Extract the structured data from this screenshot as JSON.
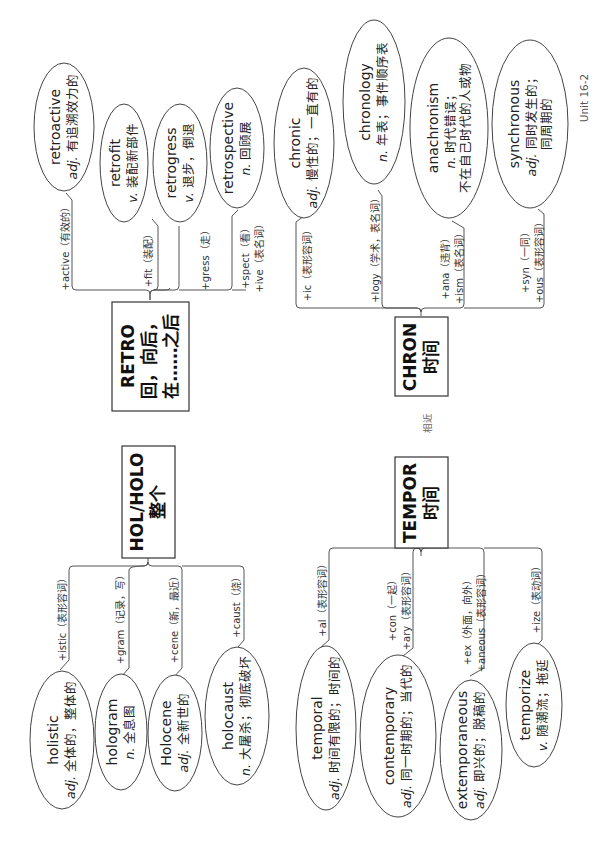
{
  "unit_label": "Unit 16-2",
  "relation_label": "相近",
  "roots": {
    "retro": {
      "title": "RETRO",
      "meaning_lines": [
        "回，向后，",
        "在……之后"
      ],
      "branches": [
        {
          "affix_lines": [
            "+active（有效的）"
          ],
          "word": "retroactive",
          "pos": "adj.",
          "definition_lines": [
            "有追溯效力的"
          ]
        },
        {
          "affix_lines": [
            "+fit（装配）"
          ],
          "word": "retrofit",
          "pos": "v.",
          "definition_lines": [
            "装配新部件"
          ]
        },
        {
          "affix_lines": [
            "+gress（走）"
          ],
          "word": "retrogress",
          "pos": "v.",
          "definition_lines": [
            "退步，倒退"
          ]
        },
        {
          "affix_lines": [
            "+spect（看）",
            "+ive（表名词）"
          ],
          "word": "retrospective",
          "pos": "n.",
          "definition_lines": [
            "回顾展"
          ]
        }
      ]
    },
    "chron": {
      "title": "CHRON",
      "meaning_lines": [
        "时间"
      ],
      "branches": [
        {
          "affix_lines": [
            "+ic（表形容词）"
          ],
          "word": "chronic",
          "pos": "adj.",
          "definition_lines": [
            "慢性的；一直有的"
          ]
        },
        {
          "affix_lines": [
            "+logy（学术，表名词）"
          ],
          "word": "chronology",
          "pos": "n.",
          "definition_lines": [
            "年表；事件顺序表"
          ]
        },
        {
          "affix_lines": [
            "+ana（违背）",
            "+ism（表名词）"
          ],
          "word": "anachronism",
          "pos": "n.",
          "definition_lines": [
            "时代错误；",
            "不在自己时代的人或物"
          ]
        },
        {
          "affix_lines": [
            "+syn（一同）",
            "+ous（表形容词）"
          ],
          "word": "synchronous",
          "pos": "adj.",
          "definition_lines": [
            "同时发生的；",
            "同周期的"
          ]
        }
      ]
    },
    "hol": {
      "title": "HOL/HOLO",
      "meaning_lines": [
        "整个"
      ],
      "branches": [
        {
          "affix_lines": [
            "+istic（表形容词）"
          ],
          "word": "holistic",
          "pos": "adj.",
          "definition_lines": [
            "全体的，整体的"
          ]
        },
        {
          "affix_lines": [
            "+gram（记录，写）"
          ],
          "word": "hologram",
          "pos": "n.",
          "definition_lines": [
            "全息图"
          ]
        },
        {
          "affix_lines": [
            "+cene（新，最近）"
          ],
          "word": "Holocene",
          "pos": "adj.",
          "definition_lines": [
            "全新世的"
          ]
        },
        {
          "affix_lines": [
            "+caust（烧）"
          ],
          "word": "holocaust",
          "pos": "n.",
          "definition_lines": [
            "大屠杀；彻底破坏"
          ]
        }
      ]
    },
    "tempor": {
      "title": "TEMPOR",
      "meaning_lines": [
        "时间"
      ],
      "branches": [
        {
          "affix_lines": [
            "+al（表形容词）"
          ],
          "word": "temporal",
          "pos": "adj.",
          "definition_lines": [
            "时间有限的；时间的"
          ]
        },
        {
          "affix_lines": [
            "+con（一起）",
            "+ary（表形容词）"
          ],
          "word": "contemporary",
          "pos": "adj.",
          "definition_lines": [
            "同一时期的；当代的"
          ]
        },
        {
          "affix_lines": [
            "+ex（外面，向外）",
            "+aneous（表形容词）"
          ],
          "word": "extemporaneous",
          "pos": "adj.",
          "definition_lines": [
            "即兴的；脱稿的"
          ]
        },
        {
          "affix_lines": [
            "+ize（表动词）"
          ],
          "word": "temporize",
          "pos": "v.",
          "definition_lines": [
            "随潮流；拖延"
          ]
        }
      ]
    }
  }
}
